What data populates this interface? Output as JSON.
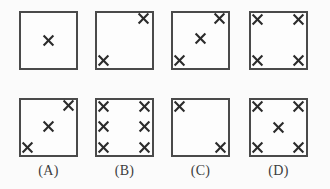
{
  "figure": {
    "kind": "multiple-choice-diagram",
    "background_color": "#fbfbfb",
    "box_border_color": "#4a4a4a",
    "mark_color": "#2b2b2b",
    "mark_glyph": "x-mark",
    "rows": 2,
    "columns": 4,
    "box_size_px": 59
  },
  "panels": [
    {
      "id": "panel-top-1",
      "row": "top",
      "column": 0,
      "label": "",
      "mark_count": 1,
      "marks": [
        {
          "name": "x-center",
          "x_pct": 50,
          "y_pct": 50
        }
      ]
    },
    {
      "id": "panel-top-2",
      "row": "top",
      "column": 1,
      "label": "",
      "mark_count": 2,
      "marks": [
        {
          "name": "x-top-right",
          "x_pct": 83,
          "y_pct": 13
        },
        {
          "name": "x-bottom-left",
          "x_pct": 14,
          "y_pct": 84
        }
      ]
    },
    {
      "id": "panel-top-3",
      "row": "top",
      "column": 2,
      "label": "",
      "mark_count": 3,
      "marks": [
        {
          "name": "x-top-right",
          "x_pct": 83,
          "y_pct": 13
        },
        {
          "name": "x-center",
          "x_pct": 50,
          "y_pct": 47
        },
        {
          "name": "x-bottom-left",
          "x_pct": 14,
          "y_pct": 84
        }
      ]
    },
    {
      "id": "panel-top-4",
      "row": "top",
      "column": 3,
      "label": "",
      "mark_count": 4,
      "marks": [
        {
          "name": "x-top-left",
          "x_pct": 15,
          "y_pct": 14
        },
        {
          "name": "x-top-right",
          "x_pct": 84,
          "y_pct": 14
        },
        {
          "name": "x-bottom-left",
          "x_pct": 15,
          "y_pct": 84
        },
        {
          "name": "x-bottom-right",
          "x_pct": 84,
          "y_pct": 84
        }
      ]
    },
    {
      "id": "panel-option-a",
      "row": "bottom",
      "column": 0,
      "label": "(A)",
      "mark_count": 3,
      "marks": [
        {
          "name": "x-top-right",
          "x_pct": 84,
          "y_pct": 13
        },
        {
          "name": "x-center",
          "x_pct": 50,
          "y_pct": 48
        },
        {
          "name": "x-bottom-left",
          "x_pct": 14,
          "y_pct": 84
        }
      ]
    },
    {
      "id": "panel-option-b",
      "row": "bottom",
      "column": 1,
      "label": "(B)",
      "mark_count": 6,
      "marks": [
        {
          "name": "x-top-left",
          "x_pct": 15,
          "y_pct": 14
        },
        {
          "name": "x-top-right",
          "x_pct": 84,
          "y_pct": 14
        },
        {
          "name": "x-middle-left",
          "x_pct": 15,
          "y_pct": 49
        },
        {
          "name": "x-middle-right",
          "x_pct": 84,
          "y_pct": 49
        },
        {
          "name": "x-bottom-left",
          "x_pct": 15,
          "y_pct": 84
        },
        {
          "name": "x-bottom-right",
          "x_pct": 84,
          "y_pct": 84
        }
      ]
    },
    {
      "id": "panel-option-c",
      "row": "bottom",
      "column": 2,
      "label": "(C)",
      "mark_count": 2,
      "marks": [
        {
          "name": "x-top-left",
          "x_pct": 15,
          "y_pct": 14
        },
        {
          "name": "x-bottom-right",
          "x_pct": 84,
          "y_pct": 84
        }
      ]
    },
    {
      "id": "panel-option-d",
      "row": "bottom",
      "column": 3,
      "label": "(D)",
      "mark_count": 5,
      "marks": [
        {
          "name": "x-top-left",
          "x_pct": 15,
          "y_pct": 14
        },
        {
          "name": "x-top-right",
          "x_pct": 84,
          "y_pct": 14
        },
        {
          "name": "x-center",
          "x_pct": 50,
          "y_pct": 50
        },
        {
          "name": "x-bottom-left",
          "x_pct": 15,
          "y_pct": 84
        },
        {
          "name": "x-bottom-right",
          "x_pct": 84,
          "y_pct": 84
        }
      ]
    }
  ],
  "option_labels": [
    {
      "text": "(A)",
      "column": 0
    },
    {
      "text": "(B)",
      "column": 1
    },
    {
      "text": "(C)",
      "column": 2
    },
    {
      "text": "(D)",
      "column": 3
    }
  ]
}
